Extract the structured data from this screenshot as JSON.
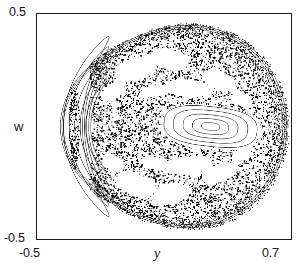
{
  "figure": {
    "kind": "poincare-section",
    "background": "#ffffff",
    "frame_color": "#1a1a1a",
    "point_color": "#000000"
  },
  "axes": {
    "x": {
      "label": "y",
      "ticks": [
        "-0.5",
        "0.7"
      ],
      "min": -0.5,
      "max": 0.7
    },
    "y": {
      "label": "w",
      "ticks": [
        "-0.5",
        "0.5"
      ],
      "min": -0.5,
      "max": 0.5
    }
  },
  "chart_data": {
    "type": "scatter",
    "title": "",
    "xlabel": "y",
    "ylabel": "w",
    "xlim": [
      -0.5,
      0.7
    ],
    "ylim": [
      -0.5,
      0.5
    ],
    "xticks": [
      -0.5,
      0.7
    ],
    "xticklabels": [
      "-0.5",
      "0.7"
    ],
    "yticks": [
      -0.5,
      0.5
    ],
    "yticklabels": [
      "-0.5",
      "0.5"
    ],
    "grid": false,
    "legend": null,
    "series": [
      {
        "name": "chaotic-sea",
        "kind": "stochastic-region",
        "color": "#000000",
        "density": 0.97,
        "n_points": 46000,
        "boundary_hint": "teardrop: rounded on the left (y=-0.47), tapering to a cusp on the right (y=+0.66), symmetric about w=0"
      },
      {
        "name": "outer-kam-curves-left",
        "kind": "invariant-curves",
        "color": "#000000",
        "count": 5,
        "center": [
          -0.33,
          0.0
        ],
        "semi_axes": [
          [
            0.045,
            0.4
          ],
          [
            0.036,
            0.355
          ],
          [
            0.028,
            0.305
          ],
          [
            0.02,
            0.255
          ],
          [
            0.012,
            0.205
          ]
        ]
      },
      {
        "name": "outer-kam-curves-boundary",
        "kind": "invariant-curves",
        "color": "#000000",
        "count": 3,
        "note": "thin curves tracing the outer teardrop boundary"
      },
      {
        "name": "primary-island-center",
        "kind": "island-chain",
        "color": "#000000",
        "center": [
          0.32,
          0.0
        ],
        "count": 5,
        "semi_axes": [
          [
            0.215,
            0.082
          ],
          [
            0.172,
            0.065
          ],
          [
            0.126,
            0.048
          ],
          [
            0.082,
            0.031
          ],
          [
            0.04,
            0.016
          ]
        ],
        "fixed_point": [
          0.32,
          0.0
        ]
      },
      {
        "name": "secondary-islands-upper",
        "kind": "island-chain",
        "color": "#000000",
        "count": 4,
        "centers": [
          [
            -0.04,
            0.255
          ],
          [
            0.12,
            0.3
          ],
          [
            0.2,
            0.175
          ],
          [
            0.34,
            0.215
          ]
        ]
      },
      {
        "name": "secondary-islands-lower",
        "kind": "island-chain",
        "color": "#000000",
        "count": 4,
        "centers": [
          [
            -0.04,
            -0.255
          ],
          [
            0.12,
            -0.3
          ],
          [
            0.2,
            -0.175
          ],
          [
            0.34,
            -0.215
          ]
        ]
      }
    ]
  }
}
